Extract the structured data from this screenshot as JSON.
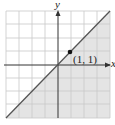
{
  "diagram": {
    "type": "linear-inequality-graph",
    "axes": {
      "x_label": "x",
      "y_label": "y"
    },
    "grid": {
      "columns": 8,
      "rows": 8
    },
    "boundary_line": "y = x",
    "shaded_region": "below line",
    "point": {
      "label": "(1, 1)",
      "x": 1,
      "y": 1
    },
    "colors": {
      "shade": "#e4e4e4",
      "grid": "#c8c8c8",
      "line": "#555555",
      "axis": "#333333"
    }
  }
}
